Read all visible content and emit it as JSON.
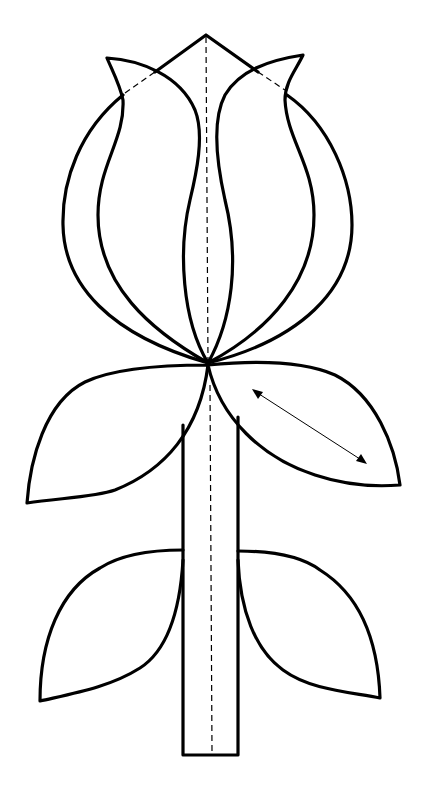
{
  "diagram": {
    "parts": [
      {
        "id": "flower-head",
        "label": "Tulip flower head"
      },
      {
        "id": "center-petal",
        "label": "Center pointed petal"
      },
      {
        "id": "left-inner-petal",
        "label": "Left inner petal"
      },
      {
        "id": "right-inner-petal",
        "label": "Right inner petal"
      },
      {
        "id": "left-outer-petal",
        "label": "Left outer petal"
      },
      {
        "id": "right-outer-petal",
        "label": "Right outer petal"
      },
      {
        "id": "upper-left-leaf",
        "label": "Upper left leaf"
      },
      {
        "id": "upper-right-leaf",
        "label": "Upper right leaf"
      },
      {
        "id": "lower-left-leaf",
        "label": "Lower left leaf"
      },
      {
        "id": "lower-right-leaf",
        "label": "Lower right leaf"
      },
      {
        "id": "stem",
        "label": "Stem"
      }
    ],
    "line_types": {
      "solid": "cut line",
      "dashed": "fold line",
      "double-arrow": "grain / direction marker"
    },
    "colors": {
      "background": "#ffffff",
      "stroke": "#000000"
    }
  }
}
